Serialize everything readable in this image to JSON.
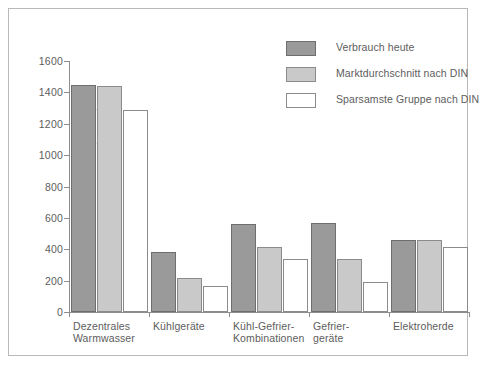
{
  "chart_data": {
    "type": "bar",
    "title": "",
    "xlabel": "",
    "ylabel": "Jahresstromverbrauch (kWh/a)",
    "ylim": [
      0,
      1600
    ],
    "yticks": [
      0,
      200,
      400,
      600,
      800,
      1000,
      1200,
      1400,
      1600
    ],
    "grid": false,
    "legend_position": "top-right",
    "categories": [
      "Dezentrales\nWarmwasser",
      "Kühlgeräte",
      "Kühl-Gefrier-\nKombinationen",
      "Gefrier-\ngeräte",
      "Elektroherde"
    ],
    "series": [
      {
        "name": "Verbrauch heute",
        "color": "#9a9a9a",
        "values": [
          1450,
          385,
          560,
          565,
          460
        ]
      },
      {
        "name": "Marktdurchschnitt nach DIN",
        "color": "#c9c9c9",
        "values": [
          1440,
          215,
          415,
          335,
          460
        ]
      },
      {
        "name": "Sparsamste Gruppe nach DIN",
        "color": "#ffffff",
        "values": [
          1290,
          165,
          340,
          190,
          415
        ]
      }
    ]
  },
  "legend": {
    "items": [
      {
        "label": "Verbrauch heute"
      },
      {
        "label": "Marktdurchschnitt nach DIN"
      },
      {
        "label": "Sparsamste Gruppe nach DIN"
      }
    ]
  },
  "caption": ""
}
